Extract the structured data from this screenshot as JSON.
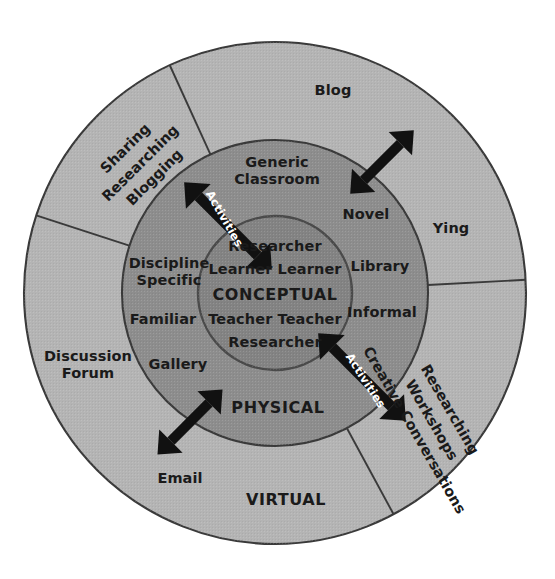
{
  "figure": {
    "shape": "concentric-circles"
  },
  "colors": {
    "outer_ring_fill": "#b4b4b4",
    "middle_ring_fill": "#8d8d8d",
    "inner_circle_fill": "#838383",
    "stroke": "#3a3a3a",
    "text": "#1a1a1a",
    "arrow": "#111111",
    "arrow_label_text": "#ffffff",
    "background": "#ffffff"
  },
  "rings": {
    "inner": {
      "zone_label": "CONCEPTUAL",
      "roles_above": [
        "Researcher",
        "Learner  Learner"
      ],
      "roles_below": [
        "Teacher  Teacher",
        "Researcher"
      ],
      "role_researcher_top": "Researcher",
      "role_learners": "Learner  Learner",
      "role_teachers": "Teacher  Teacher",
      "role_researcher_bottom": "Researcher"
    },
    "middle": {
      "zone_label": "PHYSICAL",
      "labels": [
        "Generic Classroom",
        "Novel",
        "Library",
        "Informal",
        "Discipline Specific",
        "Familiar",
        "Gallery"
      ],
      "generic_classroom_line1": "Generic",
      "generic_classroom_line2": "Classroom",
      "novel": "Novel",
      "library": "Library",
      "informal": "Informal",
      "discipline_line1": "Discipline",
      "discipline_line2": "Specific",
      "familiar": "Familiar",
      "gallery": "Gallery"
    },
    "outer": {
      "zone_label": "VIRTUAL",
      "labels": [
        "Blog",
        "Ying",
        "Discussion Forum",
        "Email"
      ],
      "blog": "Blog",
      "ying": "Ying",
      "discussion_forum_line1": "Discussion",
      "discussion_forum_line2": "Forum",
      "email": "Email",
      "sector_top_left": {
        "name": "sharing-researching-blogging-sector",
        "lines": [
          "Sharing",
          "Researching",
          "Blogging"
        ],
        "line1": "Sharing",
        "line2": "Researching",
        "line3": "Blogging",
        "rotation_deg": -45
      },
      "sector_bottom_right": {
        "name": "researching-workshops-creative-conversations-sector",
        "lines": [
          "Researching",
          "Workshops",
          "Creative Conversations"
        ],
        "line1": "Researching",
        "line2": "Workshops",
        "line3": "Creative Conversations",
        "rotation_deg": 60
      }
    }
  },
  "arrows": [
    {
      "name": "activities-arrow-top-left",
      "label": "Activities",
      "has_label": true,
      "direction": "double-headed",
      "angle_deg": -45
    },
    {
      "name": "arrow-top-right",
      "label": "",
      "has_label": false,
      "direction": "double-headed",
      "angle_deg": 45
    },
    {
      "name": "activities-arrow-bottom-right",
      "label": "Activities",
      "has_label": true,
      "direction": "double-headed",
      "angle_deg": 45
    },
    {
      "name": "arrow-bottom-left",
      "label": "",
      "has_label": false,
      "direction": "double-headed",
      "angle_deg": -45
    }
  ]
}
